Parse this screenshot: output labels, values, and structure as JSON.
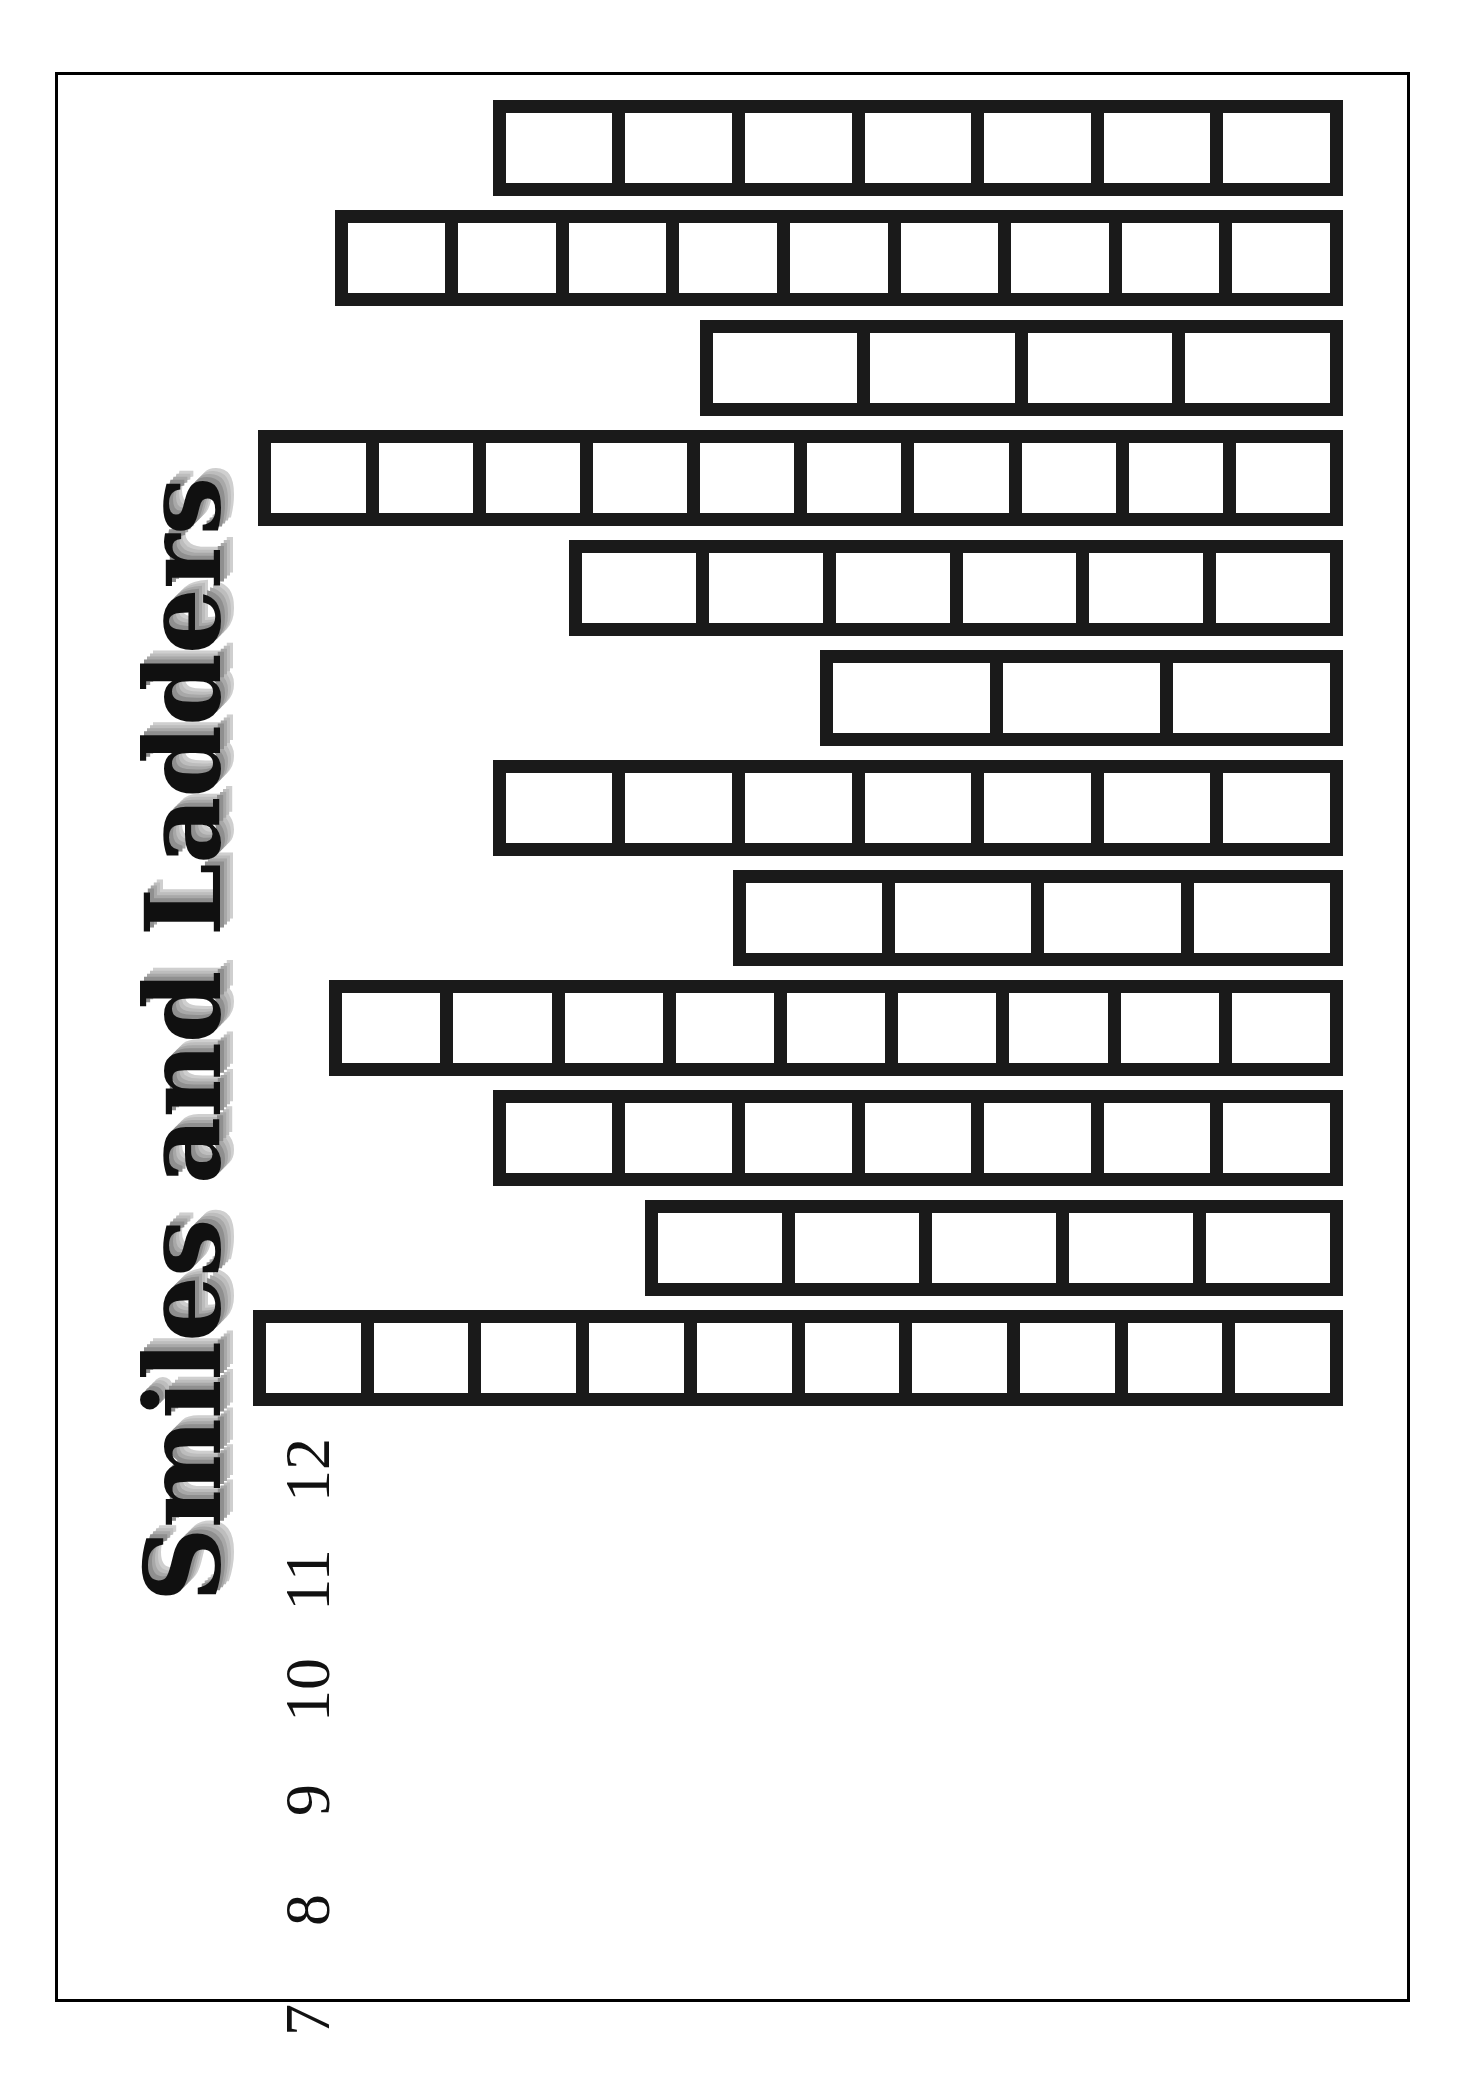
{
  "document": {
    "title": "Smiles and Ladders",
    "orientation": "landscape-rotated",
    "frame_color": "#000000",
    "ink_color": "#1a1a1a",
    "background_color": "#ffffff"
  },
  "chart_data": {
    "type": "bar",
    "title": "Smiles and Ladders",
    "orientation": "horizontal-rotated",
    "xlabel": "",
    "ylabel": "",
    "grid": false,
    "legend": null,
    "categories": [
      "1",
      "2",
      "3",
      "4",
      "5",
      "6",
      "7",
      "8",
      "9",
      "10",
      "11",
      "12"
    ],
    "values": [
      10,
      5,
      7,
      9,
      4,
      7,
      3,
      6,
      10,
      4,
      9,
      7
    ],
    "value_unit": "ladder rungs",
    "ylim": [
      0,
      11
    ],
    "bars": [
      {
        "label": "1",
        "rungs": 10,
        "start_pct": 0.0,
        "length_pct": 100.0
      },
      {
        "label": "2",
        "rungs": 5,
        "start_pct": 36.0,
        "length_pct": 64.0
      },
      {
        "label": "3",
        "rungs": 7,
        "start_pct": 22.0,
        "length_pct": 78.0
      },
      {
        "label": "4",
        "rungs": 9,
        "start_pct": 7.0,
        "length_pct": 93.0
      },
      {
        "label": "5",
        "rungs": 4,
        "start_pct": 44.0,
        "length_pct": 56.0
      },
      {
        "label": "6",
        "rungs": 7,
        "start_pct": 22.0,
        "length_pct": 78.0
      },
      {
        "label": "7",
        "rungs": 3,
        "start_pct": 52.0,
        "length_pct": 48.0
      },
      {
        "label": "8",
        "rungs": 6,
        "start_pct": 29.0,
        "length_pct": 71.0
      },
      {
        "label": "9",
        "rungs": 10,
        "start_pct": 0.5,
        "length_pct": 99.5
      },
      {
        "label": "10",
        "rungs": 4,
        "start_pct": 41.0,
        "length_pct": 59.0
      },
      {
        "label": "11",
        "rungs": 9,
        "start_pct": 7.5,
        "length_pct": 92.5
      },
      {
        "label": "12",
        "rungs": 7,
        "start_pct": 22.0,
        "length_pct": 78.0
      }
    ],
    "axis_ticks": [
      "1",
      "2",
      "3",
      "4",
      "5",
      "6",
      "7",
      "8",
      "9",
      "10",
      "11",
      "12"
    ]
  }
}
